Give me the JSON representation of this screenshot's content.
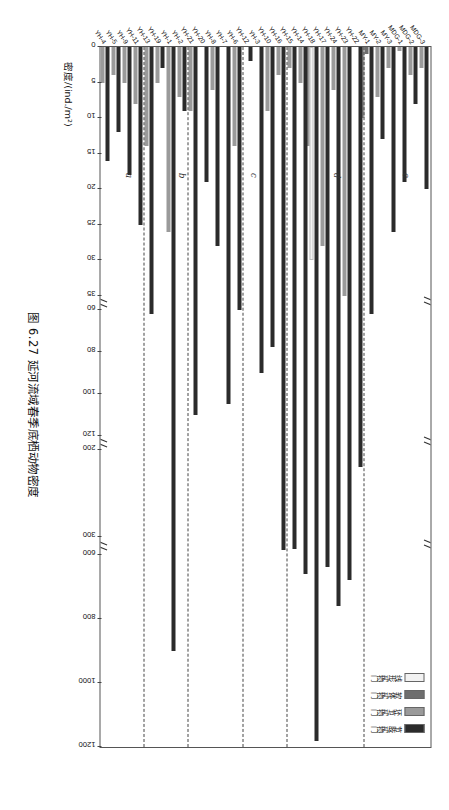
{
  "caption": "图 6.27  延河流域春季底栖动物密度",
  "legend": {
    "items": [
      {
        "label": "节肢动物门",
        "color": "#2b2b2b",
        "key": "arthropoda"
      },
      {
        "label": "环节动物门",
        "color": "#9a9a9a",
        "key": "annelida"
      },
      {
        "label": "软体动物门",
        "color": "#6e6e6e",
        "key": "mollusca"
      },
      {
        "label": "线形动物门",
        "color": "#f2f2f2",
        "key": "nematomorpha"
      }
    ]
  },
  "panel_letters": [
    "a",
    "b",
    "c",
    "d",
    "e"
  ],
  "groups": [
    {
      "name": "黄土丘陵区",
      "count": 6
    },
    {
      "name": "森林草原区",
      "count": 4
    },
    {
      "name": "河源水区",
      "count": 3
    },
    {
      "name": "延河二期",
      "count": 4
    },
    {
      "name": "延河三期",
      "count": 4
    },
    {
      "name": "丰富区",
      "count": 3
    },
    {
      "name": "王窑水库",
      "count": 3
    },
    {
      "name": "包茂区",
      "count": 3
    }
  ],
  "chart_data": {
    "type": "bar",
    "orientation": "horizontal",
    "title": "图 6.27  延河流域春季底栖动物密度",
    "xlabel": "密度/(ind./m²)",
    "ylabel": "",
    "stacked": true,
    "grid": false,
    "legend_position": "top-left",
    "axis_breaks": [
      [
        35,
        60
      ],
      [
        120,
        200
      ],
      [
        300,
        600
      ]
    ],
    "xticks": [
      0,
      5,
      10,
      15,
      20,
      25,
      30,
      35,
      60,
      80,
      100,
      120,
      200,
      300,
      600,
      800,
      1000,
      1200
    ],
    "xlim": [
      0,
      1200
    ],
    "series": [
      {
        "name": "节肢动物门",
        "color": "#2b2b2b"
      },
      {
        "name": "环节动物门",
        "color": "#9a9a9a"
      },
      {
        "name": "软体动物门",
        "color": "#6e6e6e"
      },
      {
        "name": "线形动物门",
        "color": "#f2f2f2"
      }
    ],
    "categories": [
      "MDG-3",
      "MDG-2",
      "MDG-1",
      "MY-3",
      "MY-2",
      "MY-1",
      "YH-22",
      "YH-23",
      "YH-24",
      "YH-17",
      "YH-18",
      "YH-14",
      "YH-15",
      "YH-16",
      "YH-10",
      "YH-3",
      "YH-12",
      "YH-6",
      "YH-7",
      "YH-8",
      "YH-20",
      "YH-21",
      "YH-2",
      "YH-1",
      "YH-19",
      "YH-13",
      "YH-11",
      "YH-9",
      "YH-5",
      "YH-4"
    ],
    "values": {
      "节肢动物门": [
        20,
        8,
        19,
        26,
        13,
        62,
        220,
        680,
        760,
        640,
        1180,
        660,
        500,
        530,
        78,
        90,
        2,
        60,
        105,
        28,
        19,
        110,
        9,
        900,
        3,
        62,
        25,
        18,
        12,
        16
      ],
      "环节动物门": [
        3,
        4,
        0,
        3,
        7,
        10,
        0,
        36,
        6,
        28,
        14,
        5,
        3,
        4,
        9,
        0,
        0,
        0,
        14,
        6,
        0,
        0,
        7,
        26,
        5,
        14,
        8,
        5,
        4,
        5
      ],
      "软体动物门": [
        0,
        0,
        0,
        0,
        0,
        1,
        0,
        0,
        0,
        0,
        0,
        0,
        0,
        0,
        0,
        0,
        0,
        0,
        0,
        0,
        0,
        0,
        0,
        0,
        0,
        0,
        0,
        0,
        0,
        0
      ],
      "线形动物门": [
        0,
        0,
        0,
        0,
        0,
        0,
        0,
        0,
        0,
        0,
        30,
        0,
        0,
        0,
        0,
        0,
        0,
        0,
        0,
        0,
        0,
        0,
        0,
        0,
        5,
        0,
        0,
        0,
        0,
        0
      ]
    },
    "bars": [
      {
        "cat": "MDG-3",
        "segs": [
          {
            "s": 0,
            "v": 20.0
          },
          {
            "s": 1,
            "v": 3.0
          }
        ]
      },
      {
        "cat": "MDG-2",
        "segs": [
          {
            "s": 0,
            "v": 8.0
          },
          {
            "s": 1,
            "v": 4.0
          }
        ]
      },
      {
        "cat": "MDG-1",
        "segs": [
          {
            "s": 0,
            "v": 19.0
          },
          {
            "s": 1,
            "v": 0.5
          }
        ]
      },
      {
        "cat": "MY-3",
        "segs": [
          {
            "s": 0,
            "v": 26.0
          },
          {
            "s": 1,
            "v": 3.0
          }
        ]
      },
      {
        "cat": "MY-2",
        "segs": [
          {
            "s": 0,
            "v": 13.0
          },
          {
            "s": 1,
            "v": 7.0
          }
        ]
      },
      {
        "cat": "MY-1",
        "segs": [
          {
            "s": 0,
            "v": 62.0
          },
          {
            "s": 1,
            "v": 10.0
          },
          {
            "s": 2,
            "v": 1.0
          }
        ]
      },
      {
        "cat": "YH-22",
        "segs": [
          {
            "s": 0,
            "v": 220.0
          },
          {
            "s": 1,
            "v": 0.0
          }
        ]
      },
      {
        "cat": "YH-23",
        "segs": [
          {
            "s": 0,
            "v": 680.0
          },
          {
            "s": 1,
            "v": 36.0
          }
        ]
      },
      {
        "cat": "YH-24",
        "segs": [
          {
            "s": 0,
            "v": 760.0
          },
          {
            "s": 1,
            "v": 6.0
          }
        ]
      },
      {
        "cat": "YH-17",
        "segs": [
          {
            "s": 0,
            "v": 640.0
          },
          {
            "s": 1,
            "v": 28.0
          }
        ]
      },
      {
        "cat": "YH-18",
        "segs": [
          {
            "s": 0,
            "v": 1180.0
          },
          {
            "s": 1,
            "v": 14.0
          },
          {
            "s": 3,
            "v": 30.0
          }
        ]
      },
      {
        "cat": "YH-14",
        "segs": [
          {
            "s": 0,
            "v": 660.0
          },
          {
            "s": 1,
            "v": 5.0
          }
        ]
      },
      {
        "cat": "YH-15",
        "segs": [
          {
            "s": 0,
            "v": 500.0
          },
          {
            "s": 1,
            "v": 3.0
          }
        ]
      },
      {
        "cat": "YH-16",
        "segs": [
          {
            "s": 0,
            "v": 530.0
          },
          {
            "s": 1,
            "v": 4.0
          }
        ]
      },
      {
        "cat": "YH-10",
        "segs": [
          {
            "s": 0,
            "v": 78.0
          },
          {
            "s": 1,
            "v": 9.0
          }
        ]
      },
      {
        "cat": "YH-3",
        "segs": [
          {
            "s": 0,
            "v": 90.0
          },
          {
            "s": 1,
            "v": 0.0
          }
        ]
      },
      {
        "cat": "YH-12",
        "segs": [
          {
            "s": 0,
            "v": 2.0
          },
          {
            "s": 1,
            "v": 0.0
          }
        ]
      },
      {
        "cat": "YH-6",
        "segs": [
          {
            "s": 0,
            "v": 60.0
          },
          {
            "s": 1,
            "v": 14.0
          }
        ]
      },
      {
        "cat": "YH-7",
        "segs": [
          {
            "s": 0,
            "v": 105.0
          },
          {
            "s": 1,
            "v": 0.0
          }
        ]
      },
      {
        "cat": "YH-8",
        "segs": [
          {
            "s": 0,
            "v": 28.0
          },
          {
            "s": 1,
            "v": 6.0
          }
        ]
      },
      {
        "cat": "YH-20",
        "segs": [
          {
            "s": 0,
            "v": 19.0
          },
          {
            "s": 1,
            "v": 0.0
          }
        ]
      },
      {
        "cat": "YH-21",
        "segs": [
          {
            "s": 0,
            "v": 110.0
          },
          {
            "s": 1,
            "v": 9.0
          }
        ]
      },
      {
        "cat": "YH-2",
        "segs": [
          {
            "s": 0,
            "v": 9.0
          },
          {
            "s": 1,
            "v": 7.0
          }
        ]
      },
      {
        "cat": "YH-1",
        "segs": [
          {
            "s": 0,
            "v": 900.0
          },
          {
            "s": 1,
            "v": 26.0
          }
        ]
      },
      {
        "cat": "YH-19",
        "segs": [
          {
            "s": 0,
            "v": 3.0
          },
          {
            "s": 1,
            "v": 5.0
          }
        ]
      },
      {
        "cat": "YH-13",
        "segs": [
          {
            "s": 0,
            "v": 62.0
          },
          {
            "s": 1,
            "v": 14.0
          }
        ]
      },
      {
        "cat": "YH-11",
        "segs": [
          {
            "s": 0,
            "v": 25.0
          },
          {
            "s": 1,
            "v": 8.0
          }
        ]
      },
      {
        "cat": "YH-9",
        "segs": [
          {
            "s": 0,
            "v": 18.0
          },
          {
            "s": 1,
            "v": 5.0
          }
        ]
      },
      {
        "cat": "YH-5",
        "segs": [
          {
            "s": 0,
            "v": 12.0
          },
          {
            "s": 1,
            "v": 4.0
          }
        ]
      },
      {
        "cat": "YH-4",
        "segs": [
          {
            "s": 0,
            "v": 16.0
          },
          {
            "s": 1,
            "v": 5.0
          }
        ]
      }
    ]
  }
}
